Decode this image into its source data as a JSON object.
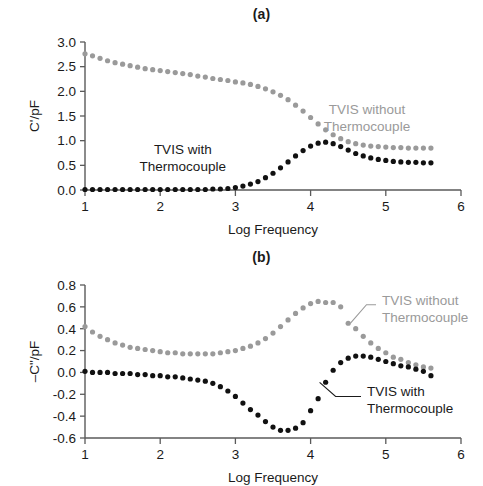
{
  "figure": {
    "panels": [
      {
        "key": "a",
        "title": "(a)",
        "xlabel": "Log Frequency",
        "ylabel": "C'/pF"
      },
      {
        "key": "b",
        "title": "(b)",
        "xlabel": "Log Frequency",
        "ylabel": "–C\"/pF"
      }
    ]
  },
  "colors": {
    "series_gray": "#9a9a9a",
    "series_black": "#111111",
    "axis": "#5a5a5a",
    "text": "#1a1a1a"
  },
  "chart_data": [
    {
      "type": "scatter",
      "panel": "a",
      "title": "(a)",
      "xlabel": "Log Frequency",
      "ylabel": "C'/pF",
      "xlim": [
        1,
        6
      ],
      "ylim": [
        0.0,
        3.0
      ],
      "xticks": [
        1,
        2,
        3,
        4,
        5,
        6
      ],
      "yticks": [
        0.0,
        0.5,
        1.0,
        1.5,
        2.0,
        2.5,
        3.0
      ],
      "xtick_labels": [
        "1",
        "2",
        "3",
        "4",
        "5",
        "6"
      ],
      "ytick_labels": [
        "0.0",
        "0.5",
        "1.0",
        "1.5",
        "2.0",
        "2.5",
        "3.0"
      ],
      "grid": false,
      "legend_position": "inline-annotations",
      "annotations": [
        {
          "text": "TVIS without Thermocouple",
          "lines": [
            "TVIS without",
            "Thermocouple"
          ],
          "color": "#9a9a9a",
          "x": 4.75,
          "y": 1.55
        },
        {
          "text": "TVIS with Thermocouple",
          "lines": [
            "TVIS with",
            "Thermocouple"
          ],
          "color": "#111111",
          "x": 2.3,
          "y": 0.73
        }
      ],
      "series": [
        {
          "name": "TVIS without Thermocouple",
          "color": "#9a9a9a",
          "x": [
            1.0,
            1.1,
            1.2,
            1.3,
            1.4,
            1.5,
            1.6,
            1.7,
            1.8,
            1.9,
            2.0,
            2.1,
            2.2,
            2.3,
            2.4,
            2.5,
            2.6,
            2.7,
            2.8,
            2.9,
            3.0,
            3.1,
            3.2,
            3.3,
            3.4,
            3.5,
            3.6,
            3.7,
            3.8,
            3.9,
            4.0,
            4.1,
            4.2,
            4.3,
            4.4,
            4.5,
            4.6,
            4.7,
            4.8,
            4.9,
            5.0,
            5.1,
            5.2,
            5.3,
            5.4,
            5.5,
            5.6
          ],
          "values": [
            2.76,
            2.72,
            2.67,
            2.62,
            2.58,
            2.55,
            2.52,
            2.49,
            2.46,
            2.44,
            2.42,
            2.4,
            2.38,
            2.36,
            2.34,
            2.31,
            2.29,
            2.26,
            2.24,
            2.22,
            2.19,
            2.17,
            2.14,
            2.1,
            2.05,
            1.99,
            1.92,
            1.83,
            1.72,
            1.6,
            1.47,
            1.34,
            1.22,
            1.12,
            1.04,
            0.98,
            0.94,
            0.91,
            0.89,
            0.88,
            0.87,
            0.86,
            0.86,
            0.85,
            0.85,
            0.85,
            0.85
          ]
        },
        {
          "name": "TVIS with Thermocouple",
          "color": "#111111",
          "x": [
            1.0,
            1.1,
            1.2,
            1.3,
            1.4,
            1.5,
            1.6,
            1.7,
            1.8,
            1.9,
            2.0,
            2.1,
            2.2,
            2.3,
            2.4,
            2.5,
            2.6,
            2.7,
            2.8,
            2.9,
            3.0,
            3.1,
            3.2,
            3.3,
            3.4,
            3.5,
            3.6,
            3.7,
            3.8,
            3.9,
            4.0,
            4.1,
            4.2,
            4.3,
            4.4,
            4.5,
            4.6,
            4.7,
            4.8,
            4.9,
            5.0,
            5.1,
            5.2,
            5.3,
            5.4,
            5.5,
            5.6
          ],
          "values": [
            0.01,
            0.01,
            0.01,
            0.01,
            0.01,
            0.01,
            0.01,
            0.01,
            0.01,
            0.01,
            0.01,
            0.01,
            0.01,
            0.01,
            0.01,
            0.01,
            0.01,
            0.02,
            0.02,
            0.03,
            0.05,
            0.08,
            0.12,
            0.17,
            0.25,
            0.34,
            0.45,
            0.57,
            0.69,
            0.8,
            0.89,
            0.95,
            0.97,
            0.94,
            0.88,
            0.81,
            0.74,
            0.69,
            0.65,
            0.62,
            0.6,
            0.58,
            0.57,
            0.56,
            0.56,
            0.55,
            0.55
          ]
        }
      ]
    },
    {
      "type": "scatter",
      "panel": "b",
      "title": "(b)",
      "xlabel": "Log Frequency",
      "ylabel": "–C\"/pF",
      "xlim": [
        1,
        6
      ],
      "ylim": [
        -0.6,
        0.8
      ],
      "xticks": [
        1,
        2,
        3,
        4,
        5,
        6
      ],
      "yticks": [
        -0.6,
        -0.4,
        -0.2,
        0.0,
        0.2,
        0.4,
        0.6,
        0.8
      ],
      "xtick_labels": [
        "1",
        "2",
        "3",
        "4",
        "5",
        "6"
      ],
      "ytick_labels": [
        "-0.6",
        "-0.4",
        "-0.2",
        "0.0",
        "0.2",
        "0.4",
        "0.6",
        "0.8"
      ],
      "grid": false,
      "legend_position": "inline-annotations-with-leaders",
      "annotations": [
        {
          "text": "TVIS without Thermocouple",
          "lines": [
            "TVIS without",
            "Thermocouple"
          ],
          "color": "#9a9a9a",
          "x": 4.95,
          "y": 0.62,
          "leader_from": [
            4.53,
            0.45
          ]
        },
        {
          "text": "TVIS with Thermocouple",
          "lines": [
            "TVIS with",
            "Thermocouple"
          ],
          "color": "#111111",
          "x": 4.75,
          "y": -0.22,
          "leader_from": [
            4.12,
            -0.09
          ]
        }
      ],
      "series": [
        {
          "name": "TVIS without Thermocouple",
          "color": "#9a9a9a",
          "x": [
            1.0,
            1.1,
            1.2,
            1.3,
            1.4,
            1.5,
            1.6,
            1.7,
            1.8,
            1.9,
            2.0,
            2.1,
            2.2,
            2.3,
            2.4,
            2.5,
            2.6,
            2.7,
            2.8,
            2.9,
            3.0,
            3.1,
            3.2,
            3.3,
            3.4,
            3.5,
            3.6,
            3.7,
            3.8,
            3.9,
            4.0,
            4.1,
            4.2,
            4.3,
            4.4,
            4.5,
            4.6,
            4.7,
            4.8,
            4.9,
            5.0,
            5.1,
            5.2,
            5.3,
            5.4,
            5.5,
            5.6
          ],
          "values": [
            0.42,
            0.37,
            0.33,
            0.3,
            0.27,
            0.25,
            0.23,
            0.22,
            0.21,
            0.2,
            0.19,
            0.18,
            0.18,
            0.17,
            0.17,
            0.17,
            0.17,
            0.17,
            0.18,
            0.19,
            0.2,
            0.22,
            0.24,
            0.27,
            0.31,
            0.36,
            0.42,
            0.48,
            0.54,
            0.59,
            0.63,
            0.65,
            0.64,
            0.64,
            0.6,
            0.45,
            0.4,
            0.33,
            0.27,
            0.22,
            0.18,
            0.14,
            0.12,
            0.09,
            0.07,
            0.05,
            0.04
          ]
        },
        {
          "name": "TVIS with Thermocouple",
          "color": "#111111",
          "x": [
            1.0,
            1.1,
            1.2,
            1.3,
            1.4,
            1.5,
            1.6,
            1.7,
            1.8,
            1.9,
            2.0,
            2.1,
            2.2,
            2.3,
            2.4,
            2.5,
            2.6,
            2.7,
            2.8,
            2.9,
            3.0,
            3.1,
            3.2,
            3.3,
            3.4,
            3.5,
            3.6,
            3.7,
            3.8,
            3.9,
            4.0,
            4.1,
            4.2,
            4.3,
            4.4,
            4.5,
            4.6,
            4.7,
            4.8,
            4.9,
            5.0,
            5.1,
            5.2,
            5.3,
            5.4,
            5.5,
            5.6
          ],
          "values": [
            0.01,
            0.0,
            0.0,
            0.0,
            -0.01,
            -0.01,
            -0.01,
            -0.02,
            -0.02,
            -0.03,
            -0.03,
            -0.04,
            -0.04,
            -0.05,
            -0.06,
            -0.07,
            -0.08,
            -0.1,
            -0.13,
            -0.17,
            -0.22,
            -0.28,
            -0.34,
            -0.39,
            -0.45,
            -0.5,
            -0.53,
            -0.53,
            -0.51,
            -0.46,
            -0.35,
            -0.24,
            -0.09,
            0.02,
            0.09,
            0.13,
            0.15,
            0.15,
            0.14,
            0.12,
            0.1,
            0.08,
            0.06,
            0.05,
            0.03,
            0.01,
            -0.03
          ]
        }
      ]
    }
  ]
}
